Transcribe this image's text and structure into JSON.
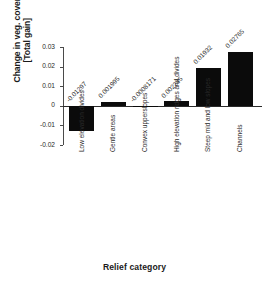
{
  "chart_data": {
    "type": "bar",
    "title": "",
    "xlabel": "Relief category",
    "ylabel": "Change in veg. cover [Total gain]",
    "ylabel_line1": "Change in veg. cover",
    "ylabel_line2": "[Total gain]",
    "categories": [
      "Low elevation divides",
      "Gentle areas",
      "Convex upperslopes",
      "High elevation ridges and divides",
      "Steep mid and low slopes",
      "Channels"
    ],
    "values": [
      -0.01297,
      0.001995,
      -0.0008171,
      0.002245,
      0.01932,
      0.02765
    ],
    "value_labels": [
      "-0.01297",
      "0.001995",
      "-0.0008171",
      "0.002245",
      "0.01932",
      "0.02765"
    ],
    "ylim": [
      -0.02,
      0.03
    ],
    "yticks": [
      0.03,
      0.02,
      0.01,
      0,
      -0.01,
      -0.02
    ],
    "ytick_labels": [
      "0.03",
      "0.02",
      "0.01",
      "0",
      "-0.01",
      "-0.02"
    ],
    "grid": false,
    "legend": "none",
    "bar_color": "#0b0b0b",
    "axis_color": "#4a4a4a",
    "background": "#ffffff"
  }
}
